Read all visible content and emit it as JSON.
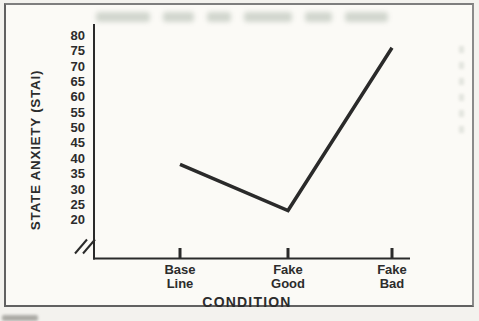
{
  "page": {
    "kind": "scanned-book-figure",
    "colors": {
      "paper": "#f3f2ee",
      "figure_paper": "#fbfaf6",
      "frame": "#616161",
      "ink": "#2c2c2c",
      "bleedthrough": "#9fab9e"
    }
  },
  "chart_data": {
    "type": "line",
    "title": "",
    "categories": [
      "Base\nLine",
      "Fake\nGood",
      "Fake\nBad"
    ],
    "values": [
      38,
      23,
      76
    ],
    "xlabel": "CONDITION",
    "ylabel": "STATE ANXIETY (STAI)",
    "yticks": [
      80,
      75,
      70,
      65,
      60,
      55,
      50,
      45,
      40,
      35,
      30,
      25,
      20
    ],
    "ylim": [
      20,
      80
    ],
    "ytick_step": 5,
    "grid": false,
    "legend": false,
    "axis_break_bottom_of_y_axis": true,
    "line_color": "#2a2a2a"
  }
}
